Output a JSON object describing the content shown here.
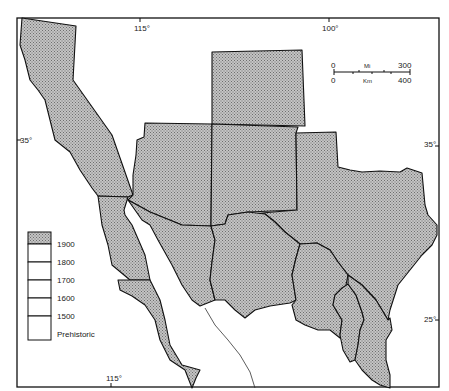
{
  "map": {
    "type": "historical-choropleth",
    "graticule": {
      "top_labels": [
        "115°",
        "100°"
      ],
      "bottom_labels": [
        "115°"
      ],
      "left_labels": [
        "35°"
      ],
      "right_labels": [
        "35°",
        "25°"
      ]
    },
    "scale_bar": {
      "miles_start": "0",
      "miles_unit": "Mi",
      "miles_end": "300",
      "km_start": "0",
      "km_unit": "Km",
      "km_end": "400"
    },
    "legend": {
      "entries": [
        {
          "label": "1900",
          "filled": true
        },
        {
          "label": "1800",
          "filled": false
        },
        {
          "label": "1700",
          "filled": false
        },
        {
          "label": "1600",
          "filled": false
        },
        {
          "label": "1500",
          "filled": false
        },
        {
          "label": "Prehistoric",
          "filled": false
        }
      ]
    },
    "colors": {
      "fill_hatch": "#9a9a9a",
      "outline": "#111111",
      "background": "#ffffff"
    }
  }
}
